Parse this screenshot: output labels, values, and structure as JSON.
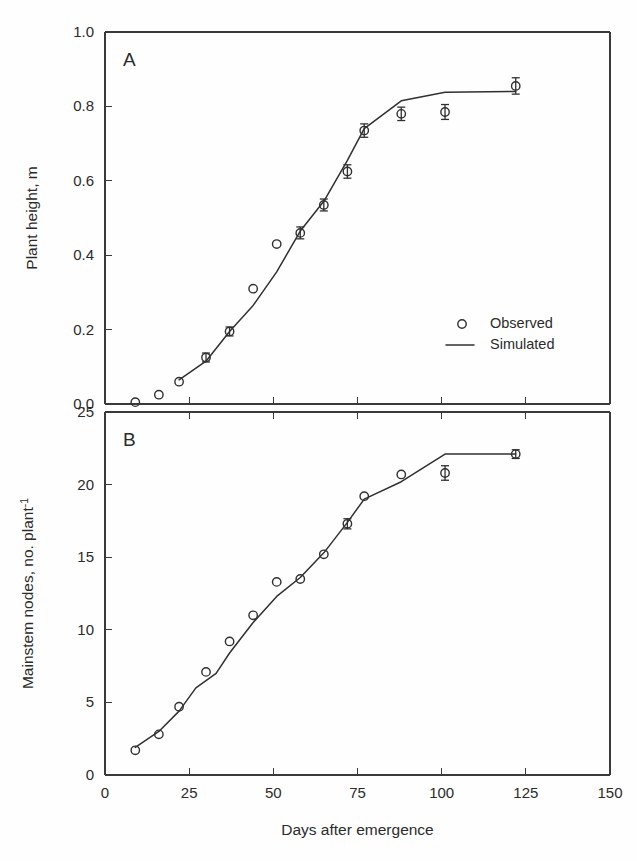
{
  "figure": {
    "background_color": "#fefefe",
    "ink_color": "#303030",
    "xlabel": "Days after emergence"
  },
  "chart_data": [
    {
      "type": "scatter",
      "panel_letter": "A",
      "title": "",
      "xlabel": "Days after emergence",
      "ylabel": "Plant height, m",
      "xlim": [
        0,
        150
      ],
      "ylim": [
        0.0,
        1.0
      ],
      "xticks": [
        0,
        25,
        50,
        75,
        100,
        125,
        150
      ],
      "xticklabels": [
        "0",
        "25",
        "50",
        "75",
        "100",
        "125",
        "150"
      ],
      "yticks": [
        0.0,
        0.2,
        0.4,
        0.6,
        0.8,
        1.0
      ],
      "yticklabels": [
        "0.0",
        "0.2",
        "0.4",
        "0.6",
        "0.8",
        "1.0"
      ],
      "grid": false,
      "legend_position": "center-right",
      "series": [
        {
          "name": "Observed",
          "marker": "open-circle",
          "x": [
            9,
            16,
            22,
            30,
            37,
            44,
            51,
            58,
            65,
            72,
            77,
            88,
            101,
            122
          ],
          "y": [
            0.005,
            0.025,
            0.06,
            0.125,
            0.195,
            0.31,
            0.43,
            0.46,
            0.535,
            0.625,
            0.735,
            0.78,
            0.785,
            0.855
          ],
          "yerr": [
            0,
            0,
            0,
            0.012,
            0.012,
            0,
            0,
            0.016,
            0.016,
            0.018,
            0.018,
            0.018,
            0.02,
            0.022
          ]
        },
        {
          "name": "Simulated",
          "marker": "line",
          "x": [
            22,
            30,
            37,
            44,
            51,
            58,
            65,
            72,
            77,
            88,
            101,
            122
          ],
          "y": [
            0.065,
            0.115,
            0.195,
            0.265,
            0.355,
            0.465,
            0.545,
            0.655,
            0.74,
            0.815,
            0.838,
            0.84
          ]
        }
      ]
    },
    {
      "type": "scatter",
      "panel_letter": "B",
      "title": "",
      "xlabel": "Days after emergence",
      "ylabel": "Mainstem nodes, no. plant",
      "ylabel_superscript": "-1",
      "xlim": [
        0,
        150
      ],
      "ylim": [
        0,
        25
      ],
      "xticks": [
        0,
        25,
        50,
        75,
        100,
        125,
        150
      ],
      "xticklabels": [
        "0",
        "25",
        "50",
        "75",
        "100",
        "125",
        "150"
      ],
      "yticks": [
        0,
        5,
        10,
        15,
        20,
        25
      ],
      "yticklabels": [
        "0",
        "5",
        "10",
        "15",
        "20",
        "25"
      ],
      "grid": false,
      "legend_position": "none",
      "series": [
        {
          "name": "Observed",
          "marker": "open-circle",
          "x": [
            9,
            16,
            22,
            30,
            37,
            44,
            51,
            58,
            65,
            72,
            77,
            88,
            101,
            122
          ],
          "y": [
            1.7,
            2.8,
            4.7,
            7.1,
            9.2,
            11.0,
            13.3,
            13.5,
            15.2,
            17.3,
            19.2,
            20.7,
            20.8,
            22.1
          ],
          "yerr": [
            0,
            0,
            0,
            0,
            0,
            0,
            0,
            0,
            0,
            0.35,
            0,
            0,
            0.5,
            0.3
          ]
        },
        {
          "name": "Simulated",
          "marker": "line",
          "x": [
            9,
            16,
            22,
            27,
            33,
            37,
            44,
            51,
            58,
            65,
            72,
            77,
            88,
            101,
            122
          ],
          "y": [
            1.9,
            3.0,
            4.4,
            6.0,
            7.0,
            8.4,
            10.5,
            12.3,
            13.6,
            15.3,
            17.4,
            19.0,
            20.2,
            22.1,
            22.1
          ]
        }
      ]
    }
  ],
  "legend": {
    "entries": [
      {
        "label": "Observed",
        "marker": "open-circle"
      },
      {
        "label": "Simulated",
        "marker": "line"
      }
    ]
  },
  "panels": {
    "a": {
      "letter": "A"
    },
    "b": {
      "letter": "B"
    }
  }
}
